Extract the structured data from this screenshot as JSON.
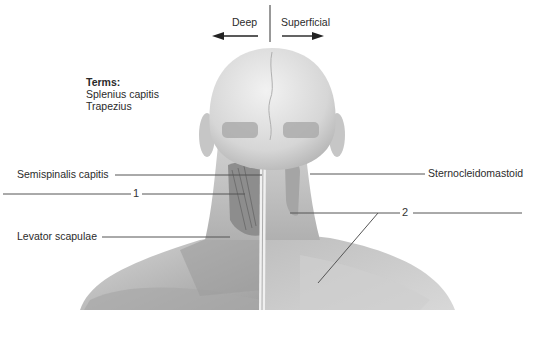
{
  "figure": {
    "orientation": {
      "left_label": "Deep",
      "right_label": "Superficial"
    },
    "terms": {
      "title": "Terms:",
      "items": [
        "Splenius capitis",
        "Trapezius"
      ]
    },
    "labels": [
      {
        "id": "semispinalis",
        "text": "Semispinalis capitis",
        "side": "left"
      },
      {
        "id": "num1",
        "text": "1",
        "side": "left"
      },
      {
        "id": "levator",
        "text": "Levator scapulae",
        "side": "left"
      },
      {
        "id": "sterno",
        "text": "Sternocleidomastoid",
        "side": "right"
      },
      {
        "id": "num2",
        "text": "2",
        "side": "right"
      }
    ],
    "colors": {
      "leader_line": "#555555",
      "skin_light": "#e6e6e6",
      "skin_mid": "#bdbdbd",
      "muscle_dark": "#8a8a8a"
    }
  }
}
